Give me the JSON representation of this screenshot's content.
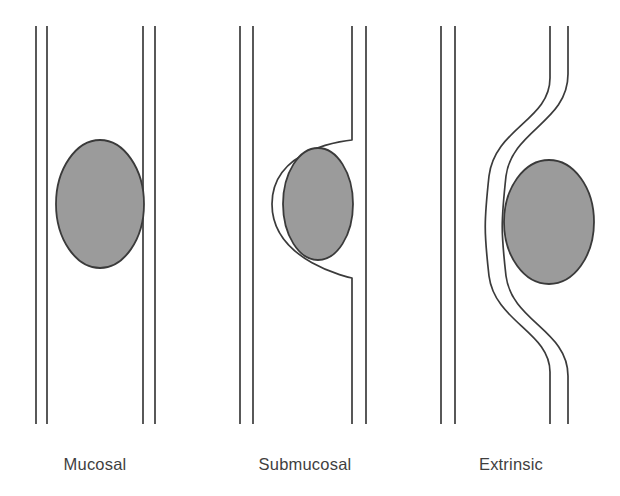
{
  "figure": {
    "background_color": "#ffffff",
    "line_color": "#3b3b3b",
    "mass_fill_color": "#9b9b9b",
    "mass_stroke_color": "#3a3a3a",
    "label_color": "#3f3f3f",
    "width": 620,
    "height": 496
  },
  "panels": [
    {
      "id": "mucosal",
      "label": "Mucosal",
      "label_x": 95,
      "label_y": 470,
      "description": "Mass arises from the mucosa and projects into the lumen; both wall layers remain straight and undisplaced.",
      "walls": {
        "left_outer": "M 36 26 L 36 424",
        "left_inner": "M 47 26 L 47 424",
        "right_inner": "M 143 26 L 143 424",
        "right_outer": "M 155 26 L 155 424"
      },
      "mass": {
        "shape": "ellipse",
        "cx": 100,
        "cy": 204,
        "rx": 44,
        "ry": 64,
        "path": "M 144 204 C 144 239 124 268 100 268 C 76 268 56 239 56 204 C 56 169 76 140 100 140 C 124 140 144 169 144 204 Z"
      }
    },
    {
      "id": "submucosal",
      "label": "Submucosal",
      "label_x": 305,
      "label_y": 470,
      "description": "Mass arises within the wall; the inner mucosal line is displaced into the lumen and arcs around the mass while the outer serosal line stays straight.",
      "walls": {
        "left_outer": "M 240 26 L 240 424",
        "left_inner": "M 253 26 L 253 424",
        "right_inner": "M 352 26 L 352 140 C 352 140 272 146 272 204 C 272 262 352 278 352 278 L 352 424",
        "right_outer": "M 366 26 L 366 424"
      },
      "mass": {
        "shape": "ellipse",
        "cx": 318,
        "cy": 204,
        "rx": 35,
        "ry": 56,
        "path": "M 353 204 C 353 235 337 260 318 260 C 299 260 283 235 283 204 C 283 173 299 148 318 148 C 337 148 353 173 353 204 Z"
      }
    },
    {
      "id": "extrinsic",
      "label": "Extrinsic",
      "label_x": 511,
      "label_y": 470,
      "description": "Mass lies outside the bowel; both wall layers are displaced together in parallel smooth S-curves and the mass indents the lumen from outside.",
      "walls": {
        "left_outer": "M 441 26 L 441 424",
        "left_inner": "M 455 26 L 455 424",
        "right_inner": "M 550 26 L 550 78 C 550 120 495 128 489 176 C 484 222 484 232 489 276 C 495 322 550 332 550 372 L 550 424",
        "right_outer": "M 568 26 L 568 74 C 568 122 512 130 506 176 C 501 222 501 232 506 276 C 512 322 568 330 568 376 L 568 424"
      },
      "mass": {
        "shape": "ellipse",
        "cx": 549,
        "cy": 222,
        "rx": 45,
        "ry": 62,
        "path": "M 594 222 C 594 256 574 284 549 284 C 524 284 504 256 504 222 C 504 188 524 160 549 160 C 574 160 594 188 594 222 Z"
      }
    }
  ]
}
